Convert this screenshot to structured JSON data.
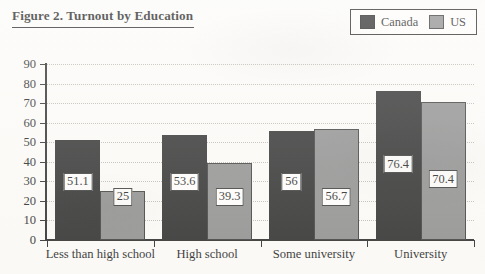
{
  "figure": {
    "title": "Figure 2. Turnout by Education"
  },
  "legend": {
    "position": "top-right",
    "entries": [
      {
        "label": "Canada",
        "color": "#1c1c1c",
        "swatch": "canada-swatch"
      },
      {
        "label": "US",
        "color": "#868686",
        "swatch": "us-swatch"
      }
    ]
  },
  "chart_data": {
    "type": "bar",
    "title": "Figure 2. Turnout by Education",
    "xlabel": "",
    "ylabel": "",
    "ylim": [
      0,
      90
    ],
    "ytick_step": 10,
    "yticks": [
      0,
      10,
      20,
      30,
      40,
      50,
      60,
      70,
      80,
      90
    ],
    "ytick_labels": [
      "0",
      "10",
      "20",
      "30",
      "40",
      "50",
      "60",
      "70",
      "80",
      "90"
    ],
    "grid": true,
    "grid_axis": "y",
    "grid_style": "dotted",
    "legend_position": "top-right",
    "categories": [
      "Less than high school",
      "High school",
      "Some university",
      "University"
    ],
    "series": [
      {
        "name": "Canada",
        "color": "#1c1c1c",
        "values": [
          51.1,
          53.6,
          56,
          76.4
        ],
        "labels": [
          "51.1",
          "53.6",
          "56",
          "76.4"
        ]
      },
      {
        "name": "US",
        "color": "#868686",
        "values": [
          25,
          39.3,
          56.7,
          70.4
        ],
        "labels": [
          "25",
          "39.3",
          "56.7",
          "70.4"
        ]
      }
    ]
  }
}
